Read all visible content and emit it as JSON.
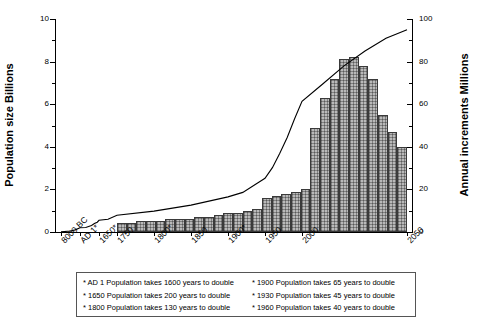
{
  "chart_data": {
    "type": "bar",
    "title": "",
    "xlabel": "",
    "ylabel": "Population size Billions",
    "y2label": "Annual increments Millions",
    "ylim": [
      0,
      10
    ],
    "y2lim": [
      0,
      100
    ],
    "grid": false,
    "legend_position": "below-plot",
    "y_ticks": [
      "0",
      "2",
      "4",
      "6",
      "8",
      "10"
    ],
    "y2_ticks": [
      "0",
      "20",
      "40",
      "60",
      "80",
      "100"
    ],
    "x_tick_labels": [
      "8000 BC",
      "AD 1*",
      "1650*",
      "1750",
      "1800*",
      "1850",
      "1900*",
      "1950",
      "2000",
      "2050"
    ],
    "x_tick_years": [
      -8000,
      1,
      1650,
      1750,
      1800,
      1850,
      1900,
      1950,
      2000,
      2050
    ],
    "series": [
      {
        "name": "Annual increments",
        "type": "bar",
        "axis": "right",
        "unit": "Millions",
        "x": [
          1755,
          1765,
          1775,
          1785,
          1795,
          1805,
          1815,
          1825,
          1835,
          1845,
          1855,
          1865,
          1875,
          1885,
          1895,
          1905,
          1915,
          1925,
          1935,
          1945,
          1955,
          1965,
          1975,
          1985,
          1995,
          2005,
          2015,
          2025,
          2035,
          2045
        ],
        "values": [
          4,
          4,
          5,
          5,
          5,
          6,
          6,
          6,
          7,
          7,
          8,
          9,
          9,
          10,
          11,
          16,
          17,
          18,
          19,
          20,
          49,
          63,
          72,
          81,
          82,
          78,
          72,
          55,
          47,
          40
        ]
      },
      {
        "name": "Population size",
        "type": "line",
        "axis": "left",
        "unit": "Billions",
        "x": [
          -8000,
          -4000,
          -2000,
          1,
          500,
          1000,
          1250,
          1500,
          1650,
          1700,
          1750,
          1800,
          1850,
          1900,
          1920,
          1940,
          1950,
          1960,
          1970,
          1980,
          1990,
          2000,
          2010,
          2020,
          2030,
          2040,
          2050
        ],
        "values": [
          0.005,
          0.05,
          0.1,
          0.2,
          0.21,
          0.31,
          0.4,
          0.46,
          0.55,
          0.6,
          0.79,
          0.98,
          1.26,
          1.65,
          1.86,
          2.3,
          2.52,
          3.02,
          3.7,
          4.44,
          5.32,
          6.14,
          6.96,
          7.8,
          8.5,
          9.1,
          9.5
        ]
      }
    ],
    "annotations": [
      "* AD 1 Population takes 1600 years to double",
      "* 1650 Population takes 200 years to double",
      "* 1800 Population takes 130 years to double",
      "* 1900 Population takes 65 years to double",
      "* 1930 Population takes 45 years to double",
      "* 1960 Population takes 40 years to double"
    ]
  },
  "axes": {
    "left": {
      "title": "Population size Billions"
    },
    "right": {
      "title": "Annual increments Millions"
    }
  },
  "legend": {
    "rows": [
      {
        "left": "* AD 1 Population takes 1600 years to double",
        "right": "* 1900 Population takes 65 years to double"
      },
      {
        "left": "* 1650 Population takes 200 years to double",
        "right": "* 1930 Population takes 45 years to double"
      },
      {
        "left": "* 1800 Population takes 130 years to double",
        "right": "* 1960 Population takes 40 years to double"
      }
    ]
  },
  "colors": {
    "bar_fill": "#b9b9b9",
    "bar_stroke": "#3a3a3a",
    "axis": "#000000",
    "background": "#ffffff"
  }
}
